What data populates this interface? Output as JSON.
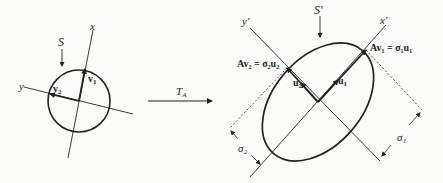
{
  "diagram": {
    "left": {
      "circle_label": "S",
      "axis_x_label": "x",
      "axis_y_label": "y",
      "vector_1_label": "v",
      "vector_1_sub": "1",
      "vector_2_label": "v",
      "vector_2_sub": "2"
    },
    "transform": {
      "label": "T",
      "sub": "A"
    },
    "right": {
      "ellipse_label": "S'",
      "axis_x_label": "x'",
      "axis_y_label": "y'",
      "u1_label": "u",
      "u1_sub": "1",
      "u2_label": "u",
      "u2_sub": "2",
      "eq1": "Av₁ = σ₁u₁",
      "eq2": "Av₂ = σ₂u₂",
      "sigma1": "σ₁",
      "sigma2": "σ₂"
    },
    "colors": {
      "ink": "#222222",
      "background": "#fbfbf9"
    }
  }
}
